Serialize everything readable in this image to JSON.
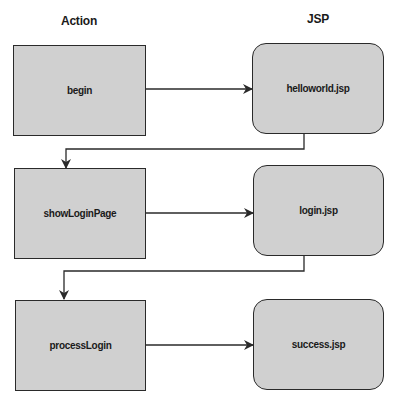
{
  "headers": {
    "action": "Action",
    "jsp": "JSP"
  },
  "actions": [
    {
      "label": "begin"
    },
    {
      "label": "showLoginPage"
    },
    {
      "label": "processLogin"
    }
  ],
  "jsps": [
    {
      "label": "helloworld.jsp"
    },
    {
      "label": "login.jsp"
    },
    {
      "label": "success.jsp"
    }
  ],
  "colors": {
    "node_fill": "#d0d0d0",
    "stroke": "#2a2a2a"
  }
}
